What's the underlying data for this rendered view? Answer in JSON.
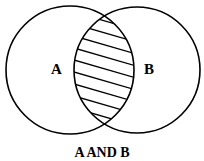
{
  "diagram": {
    "type": "venn",
    "sets": [
      {
        "label": "A",
        "cx": 70,
        "cy": 70,
        "r": 64
      },
      {
        "label": "B",
        "cx": 137,
        "cy": 70,
        "r": 63
      }
    ],
    "shaded_region": "intersection",
    "shading": "hatched",
    "caption": "A AND B",
    "stroke_color": "#000000",
    "background": "#ffffff"
  }
}
